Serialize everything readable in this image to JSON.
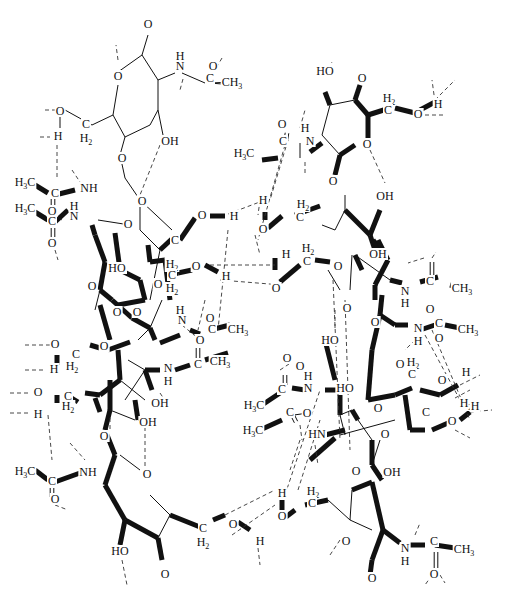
{
  "diagram": {
    "type": "chemical-structure",
    "bond_styles": [
      "thin-single",
      "bold-wedge",
      "dashed-hydrogen-bond",
      "double"
    ],
    "labels": {
      "O": "O",
      "OH": "OH",
      "HO": "HO",
      "H": "H",
      "N": "N",
      "NH": "NH",
      "HN": "HN",
      "C": "C",
      "CH3": "CH",
      "H3C": "H",
      "H2": "H",
      "sub3": "3",
      "sub2": "2",
      "H3C_tail": "C"
    }
  }
}
